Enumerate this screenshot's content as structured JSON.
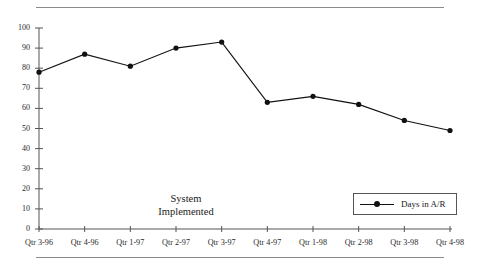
{
  "chart_data": {
    "type": "line",
    "title": "",
    "xlabel": "",
    "ylabel": "",
    "categories": [
      "Qtr 3-96",
      "Qtr 4-96",
      "Qtr 1-97",
      "Qtr 2-97",
      "Qtr 3-97",
      "Qtr 4-97",
      "Qtr 1-98",
      "Qtr 2-98",
      "Qtr 3-98",
      "Qtr 4-98"
    ],
    "series": [
      {
        "name": "Days in A/R",
        "values": [
          78,
          87,
          81,
          90,
          93,
          63,
          66,
          62,
          54,
          49
        ],
        "color": "#111111",
        "marker": "circle"
      }
    ],
    "ylim": [
      0,
      100
    ],
    "yticks": [
      0,
      10,
      20,
      30,
      40,
      50,
      60,
      70,
      80,
      90,
      100
    ],
    "ytick_labels": [
      "0",
      "10",
      "20",
      "30",
      "40",
      "50",
      "60",
      "70",
      "80",
      "90",
      "100"
    ],
    "grid": false,
    "legend_position": "inside-bottom-right",
    "annotations": [
      {
        "name": "system-implemented",
        "lines": [
          "System",
          "Implemented"
        ]
      }
    ]
  },
  "legend": {
    "entries": [
      {
        "label": "Days in A/R"
      }
    ]
  },
  "annotation": {
    "line1": "System",
    "line2": "Implemented"
  }
}
